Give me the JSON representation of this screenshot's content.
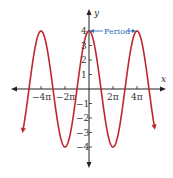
{
  "chart_data": {
    "type": "line",
    "title": "",
    "function": "y = 4cos(x/2)",
    "xlabel": "x",
    "ylabel": "y",
    "x_ticks": [
      "-4π",
      "-2π",
      "2π",
      "4π"
    ],
    "y_ticks": [
      "4",
      "3",
      "2",
      "1",
      "-1",
      "-2",
      "-3",
      "-4"
    ],
    "ylim": [
      -4,
      4
    ],
    "xlim_approx": [
      "-5.5π",
      "5.5π"
    ],
    "amplitude": 4,
    "period": "4π",
    "series": [
      {
        "name": "sinusoid",
        "color": "#c0272d",
        "x": [
          "-5.5π",
          "-4π",
          "-3π",
          "-2π",
          "-π",
          "0",
          "π",
          "2π",
          "3π",
          "4π",
          "5.5π"
        ],
        "values": [
          -2.83,
          4,
          0,
          -4,
          0,
          4,
          0,
          -4,
          0,
          4,
          -2.83
        ]
      }
    ],
    "annotations": [
      {
        "text": "Period",
        "from_x": "0",
        "to_x": "4π",
        "y": 4,
        "color": "#2a6fc0"
      }
    ],
    "grid": false
  },
  "labels": {
    "x_axis": "x",
    "y_axis": "y",
    "period": "Period",
    "xtick_m4pi": "−4π",
    "xtick_m2pi": "−2π",
    "xtick_2pi": "2π",
    "xtick_4pi": "4π",
    "ytick_4": "4",
    "ytick_3": "3",
    "ytick_2": "2",
    "ytick_1": "1",
    "ytick_m1": "−1",
    "ytick_m2": "−2",
    "ytick_m3": "−3",
    "ytick_m4": "−4"
  },
  "colors": {
    "curve": "#c0272d",
    "axes": "#222222",
    "annotation": "#2a6fc0"
  }
}
